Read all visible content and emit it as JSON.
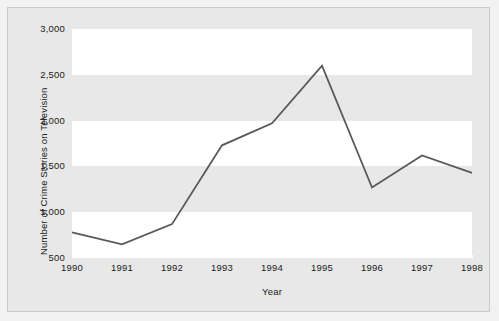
{
  "chart_data": {
    "type": "line",
    "title": "",
    "subtitle": "",
    "xlabel": "Year",
    "ylabel": "Number of Crime Stories on Television",
    "categories": [
      "1990",
      "1991",
      "1992",
      "1993",
      "1994",
      "1995",
      "1996",
      "1997",
      "1998"
    ],
    "x": [
      1990,
      1991,
      1992,
      1993,
      1994,
      1995,
      1996,
      1997,
      1998
    ],
    "values": [
      780,
      650,
      870,
      1730,
      1970,
      2600,
      1270,
      1620,
      1430
    ],
    "series": [
      {
        "name": "Number of Crime Stories on Television",
        "values": [
          780,
          650,
          870,
          1730,
          1970,
          2600,
          1270,
          1620,
          1430
        ]
      }
    ],
    "ylim": [
      500,
      3000
    ],
    "xlim": [
      1990,
      1998
    ],
    "yticks": [
      500,
      1000,
      1500,
      2000,
      2500,
      3000
    ],
    "ytick_labels": [
      "500",
      "1,000",
      "1,500",
      "2,000",
      "2,500",
      "3,000"
    ],
    "xticks": [
      1990,
      1991,
      1992,
      1993,
      1994,
      1995,
      1996,
      1997,
      1998
    ],
    "xtick_labels": [
      "1990",
      "1991",
      "1992",
      "1993",
      "1994",
      "1995",
      "1996",
      "1997",
      "1998"
    ],
    "grid": false,
    "banded_background": true,
    "legend": null,
    "legend_position": "none",
    "annotations": []
  },
  "style": {
    "line_color": "#595959",
    "band_light": "#ffffff",
    "band_dark": "#e8e8e8",
    "figure_background": "#e8e8e8",
    "page_background": "#f2f2f2",
    "text_color": "#1b1b1b",
    "frame_color": "#c9c9c9"
  }
}
